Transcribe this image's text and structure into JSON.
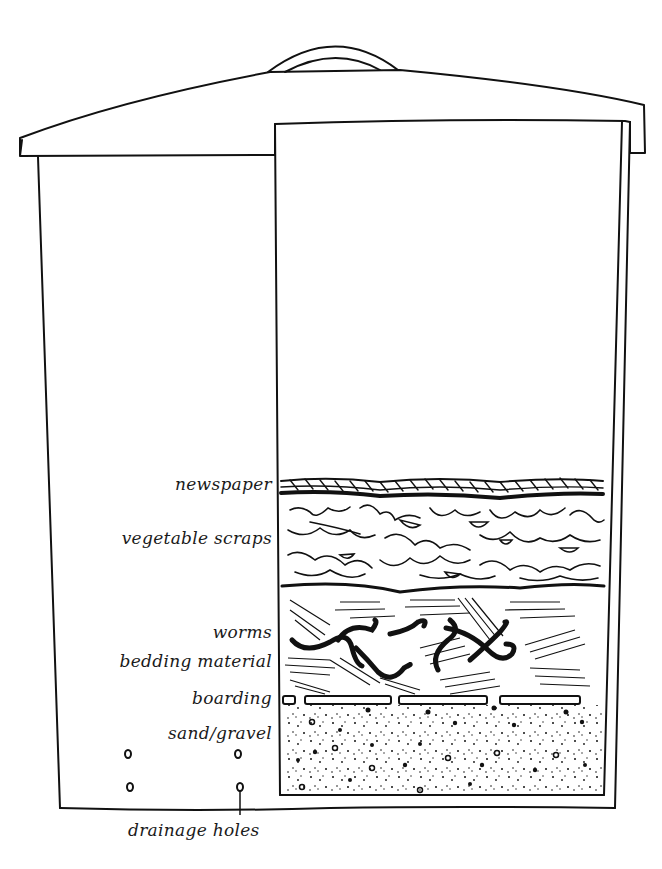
{
  "figure": {
    "line_color": "#111111",
    "background_color": "#ffffff"
  },
  "labels": {
    "newspaper": "newspaper",
    "vegetable_scraps": "vegetable scraps",
    "worms": "worms",
    "bedding_material": "bedding material",
    "boarding": "boarding",
    "sand_gravel": "sand/gravel",
    "drainage_holes": "drainage holes"
  },
  "layers": [
    {
      "name": "newspaper",
      "top": 478,
      "bottom": 497
    },
    {
      "name": "vegetable scraps",
      "top": 497,
      "bottom": 590
    },
    {
      "name": "bedding material",
      "top": 590,
      "bottom": 693
    },
    {
      "name": "boarding",
      "top": 693,
      "bottom": 705
    },
    {
      "name": "sand/gravel",
      "top": 705,
      "bottom": 793
    }
  ]
}
